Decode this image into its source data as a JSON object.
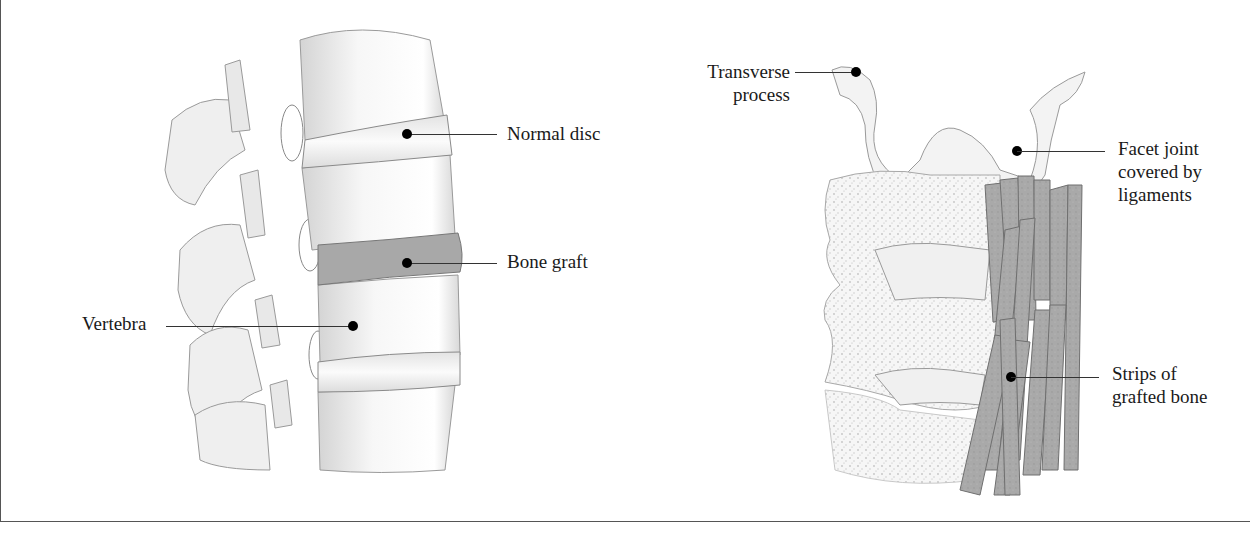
{
  "figures": {
    "left": {
      "subject": "lateral view of lumbar spine with interbody bone graft",
      "labels": {
        "normal_disc": "Normal disc",
        "bone_graft": "Bone graft",
        "vertebra": "Vertebra"
      }
    },
    "right": {
      "subject": "posterior view of spine with posterolateral strip bone grafts",
      "labels": {
        "transverse_process_line1": "Transverse",
        "transverse_process_line2": "process",
        "facet_joint_line1": "Facet joint",
        "facet_joint_line2": "covered by",
        "facet_joint_line3": "ligaments",
        "strips_line1": "Strips of",
        "strips_line2": "grafted bone"
      }
    }
  },
  "colors": {
    "bone": "#f2f2f2",
    "bone_shadow": "#c9c9c9",
    "graft": "#a6a6a6",
    "callout": "#000000",
    "frame": "#555555"
  }
}
